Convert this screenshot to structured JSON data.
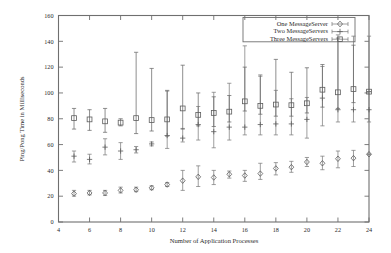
{
  "chart_data": {
    "type": "scatter",
    "title": "",
    "xlabel": "Number of Application Processes",
    "ylabel": "Ping/Pong Time in Milliseconds",
    "xlim": [
      4,
      24
    ],
    "ylim": [
      0,
      160
    ],
    "xticks": [
      4,
      6,
      8,
      10,
      12,
      14,
      16,
      18,
      20,
      22,
      24
    ],
    "yticks": [
      0,
      20,
      40,
      60,
      80,
      100,
      120,
      140,
      160
    ],
    "grid": false,
    "legend_position": "top-right",
    "error_bars": "vertical",
    "x": [
      5,
      6,
      7,
      8,
      9,
      10,
      11,
      12,
      13,
      14,
      15,
      16,
      17,
      18,
      19,
      20,
      21,
      22,
      23,
      24
    ],
    "series": [
      {
        "name": "One MessageServer",
        "marker": "diamond",
        "values": [
          22,
          22.5,
          22.5,
          24.5,
          25,
          26.5,
          29,
          32,
          35,
          34.5,
          37,
          36,
          37.5,
          41.5,
          42.5,
          46.5,
          45.5,
          49,
          49.5,
          52.5
        ],
        "err_low": [
          20,
          21,
          20.5,
          22.5,
          23.5,
          25,
          27.5,
          24.5,
          27.5,
          29,
          34,
          31.5,
          33,
          36.5,
          38.5,
          43,
          40.5,
          42,
          43,
          52.5
        ],
        "err_high": [
          24.5,
          24.5,
          24.5,
          27,
          27,
          28,
          30.5,
          40,
          43.5,
          40,
          39.5,
          40,
          45.5,
          46,
          47,
          50,
          51,
          55,
          55.5,
          52.5
        ]
      },
      {
        "name": "Two MessageServers",
        "marker": "plus",
        "values": [
          51,
          48.5,
          58,
          55,
          56,
          60.5,
          67,
          65,
          75.5,
          70,
          73.5,
          73.5,
          75.5,
          76,
          76,
          79.5,
          96,
          87,
          87,
          87
        ],
        "err_low": [
          46.5,
          45,
          52,
          48.5,
          53.5,
          59,
          57,
          62,
          63.5,
          57.5,
          63.5,
          67.5,
          67.5,
          67.5,
          67.5,
          65,
          74.5,
          77.5,
          77.5,
          77.5
        ],
        "err_high": [
          55,
          52.5,
          64.5,
          61.5,
          58.5,
          62,
          102,
          72.5,
          89.5,
          100.5,
          107.5,
          136.5,
          114,
          102,
          95.5,
          96.5,
          120.5,
          145,
          144,
          144
        ]
      },
      {
        "name": "Three MessageServers",
        "marker": "square",
        "values": [
          80.5,
          79.5,
          78,
          77,
          80.5,
          79,
          79.5,
          88,
          83,
          84.5,
          85.5,
          93.5,
          90,
          91,
          90.5,
          92,
          102.5,
          100.5,
          103,
          101
        ],
        "err_low": [
          72,
          71,
          69.5,
          74.5,
          68.5,
          70.5,
          66.5,
          72,
          74.5,
          74,
          77.5,
          86,
          83.5,
          82,
          82,
          84.5,
          89,
          88,
          92.5,
          101
        ],
        "err_high": [
          88,
          87,
          88,
          80,
          131.5,
          119,
          101.5,
          121.5,
          100,
          97,
          98,
          120,
          113,
          126,
          116,
          119.5,
          122,
          142.5,
          137,
          101
        ]
      }
    ]
  },
  "legend": {
    "entries": [
      {
        "label": "One MessageServer",
        "marker": "diamond"
      },
      {
        "label": "Two MessageServers",
        "marker": "plus"
      },
      {
        "label": "Three MessageServers",
        "marker": "square"
      }
    ]
  }
}
